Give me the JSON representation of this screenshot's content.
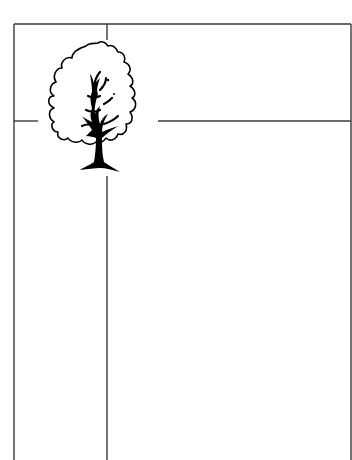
{
  "diagram": {
    "type": "quadrant-layout-sketch",
    "lines": {
      "vertical_x": 107,
      "horizontal_y": 121,
      "frame": {
        "left": 14,
        "top": 24,
        "right": 351
      }
    },
    "figure": {
      "icon": "tree-icon",
      "position": "top-left-quadrant-intersection"
    },
    "colors": {
      "line": "#333333",
      "ink": "#000000",
      "background": "#ffffff"
    }
  }
}
